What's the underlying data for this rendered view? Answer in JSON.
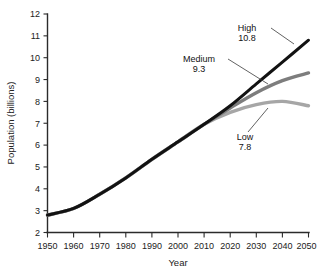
{
  "chart_data": {
    "type": "line",
    "title": "",
    "xlabel": "Year",
    "ylabel": "Population (billions)",
    "xlim": [
      1950,
      2050
    ],
    "ylim": [
      2,
      12
    ],
    "grid": false,
    "legend_position": "inline-annotations",
    "x_ticks": [
      "1950",
      "1960",
      "1970",
      "1980",
      "1990",
      "2000",
      "2010",
      "2020",
      "2030",
      "2040",
      "2050"
    ],
    "y_ticks": [
      "2",
      "3",
      "4",
      "5",
      "6",
      "7",
      "8",
      "9",
      "10",
      "11",
      "12"
    ],
    "x": [
      1950,
      1960,
      1970,
      1980,
      1990,
      2000,
      2010,
      2020,
      2030,
      2040,
      2050
    ],
    "series": [
      {
        "name": "High",
        "color": "#121212",
        "end_value": 10.8,
        "values": [
          2.8,
          3.1,
          3.75,
          4.5,
          5.35,
          6.15,
          6.95,
          7.8,
          8.8,
          9.8,
          10.8
        ]
      },
      {
        "name": "Medium",
        "color": "#7d7d7d",
        "end_value": 9.3,
        "values": [
          2.8,
          3.1,
          3.75,
          4.5,
          5.35,
          6.15,
          6.95,
          7.7,
          8.4,
          8.95,
          9.3
        ]
      },
      {
        "name": "Low",
        "color": "#a6a6a6",
        "end_value": 7.8,
        "values": [
          2.8,
          3.1,
          3.75,
          4.5,
          5.35,
          6.15,
          6.95,
          7.5,
          7.85,
          8.0,
          7.8
        ]
      }
    ],
    "annotations": [
      {
        "name": "High",
        "value": "10.8",
        "label_x": 247,
        "label_y": 31,
        "value_y": 41
      },
      {
        "name": "Medium",
        "value": "9.3",
        "label_x": 205,
        "label_y": 62,
        "value_y": 72
      },
      {
        "name": "Low",
        "value": "7.8",
        "label_x": 245,
        "label_y": 138,
        "value_y": 148
      }
    ]
  }
}
